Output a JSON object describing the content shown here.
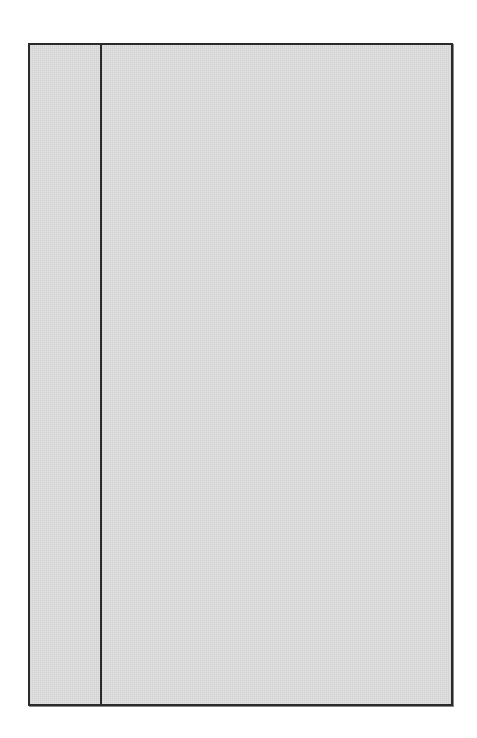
{
  "panel": {
    "left_pane": {
      "content": ""
    },
    "right_pane": {
      "content": ""
    }
  },
  "colors": {
    "fill": "#dcdcdc",
    "border": "#2a2a2a",
    "background": "#ffffff"
  }
}
